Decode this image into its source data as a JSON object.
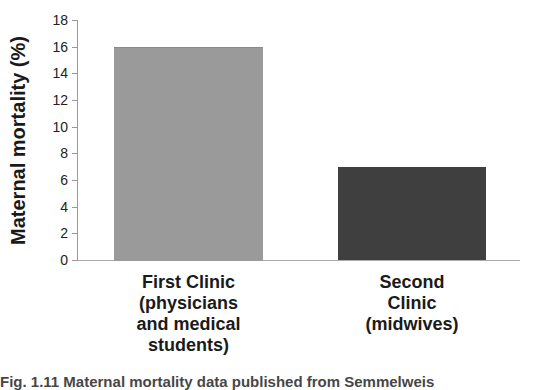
{
  "chart_data": {
    "type": "bar",
    "title": "",
    "xlabel": "",
    "ylabel": "Maternal mortality (%)",
    "ylim": [
      0,
      18
    ],
    "yticks": [
      0,
      2,
      4,
      6,
      8,
      10,
      12,
      14,
      16,
      18
    ],
    "grid": false,
    "legend": null,
    "categories": [
      "First Clinic (physicians and medical students)",
      "Second Clinic (midwives)"
    ],
    "values": [
      16,
      7
    ],
    "colors": [
      "#9a9a9a",
      "#3f3f3f"
    ]
  },
  "axis": {
    "ylabel": "Maternal mortality (%)",
    "ticks": [
      "0",
      "2",
      "4",
      "6",
      "8",
      "10",
      "12",
      "14",
      "16",
      "18"
    ]
  },
  "bars": [
    {
      "label": "First Clinic\n(physicians\nand medical\nstudents)",
      "value": 16,
      "color": "#9a9a9a"
    },
    {
      "label": "Second\nClinic\n(midwives)",
      "value": 7,
      "color": "#3f3f3f"
    }
  ],
  "caption": "Fig. 1.11 Maternal mortality data published from Semmelweis"
}
